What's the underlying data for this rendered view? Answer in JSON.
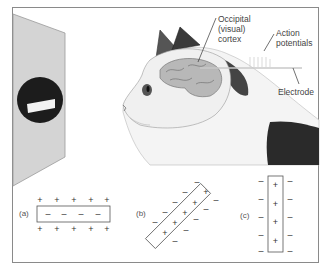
{
  "figure": {
    "labels": {
      "occipital": [
        "Occipital",
        "(visual)",
        "cortex"
      ],
      "action_potentials": [
        "Action",
        "potentials"
      ],
      "electrode": "Electrode"
    },
    "panels": [
      {
        "id": "a",
        "label": "(a)",
        "orientation": "horizontal",
        "inner_sign": "−",
        "outer_sign": "+",
        "inner_count": 4,
        "outer_count": 5
      },
      {
        "id": "b",
        "label": "(b)",
        "orientation": "diagonal",
        "inner_sign": "+",
        "outer_sign": "−",
        "inner_count": 5,
        "outer_count": 10
      },
      {
        "id": "c",
        "label": "(c)",
        "orientation": "vertical",
        "inner_sign": "+",
        "outer_sign": "−",
        "inner_count": 4,
        "outer_count": 10
      }
    ],
    "stimulus": "dark-circle-with-white-bar",
    "colors": {
      "frame": "#8a8a8a",
      "screen": "#d4d4d4",
      "stimulus_disc": "#1c1c1c",
      "cat_dark_fur": "#2a2a2a",
      "brain": "#b8b8b8"
    }
  }
}
